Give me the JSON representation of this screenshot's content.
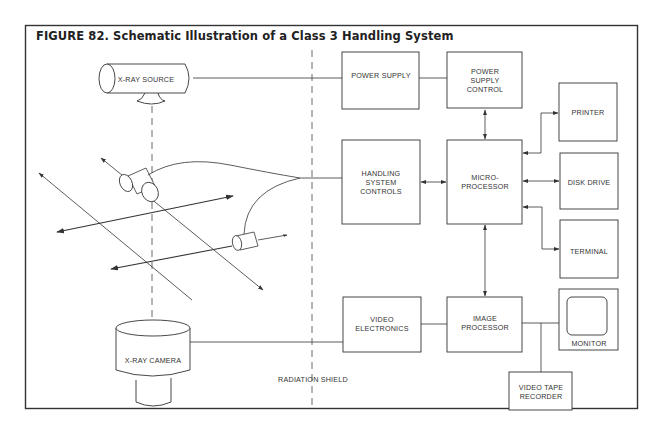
{
  "figure": {
    "title": "FIGURE 82. Schematic Illustration of a Class 3 Handling System",
    "line_color": "#333333",
    "background": "#ffffff"
  },
  "left_side": {
    "xray_source": "X-RAY SOURCE",
    "xray_camera": "X-RAY CAMERA",
    "radiation_shield": "RADIATION SHIELD"
  },
  "blocks": {
    "power_supply": [
      "POWER SUPPLY"
    ],
    "power_supply_control": [
      "POWER",
      "SUPPLY",
      "CONTROL"
    ],
    "printer": [
      "PRINTER"
    ],
    "handling_system_controls": [
      "HANDLING",
      "SYSTEM",
      "CONTROLS"
    ],
    "microprocessor": [
      "MICRO-",
      "PROCESSOR"
    ],
    "disk_drive": [
      "DISK DRIVE"
    ],
    "terminal": [
      "TERMINAL"
    ],
    "video_electronics": [
      "VIDEO",
      "ELECTRONICS"
    ],
    "image_processor": [
      "IMAGE",
      "PROCESSOR"
    ],
    "monitor": [
      "MONITOR"
    ],
    "video_tape_recorder": [
      "VIDEO TAPE",
      "RECORDER"
    ]
  },
  "connections": [
    {
      "from": "X-RAY SOURCE",
      "to": "POWER SUPPLY",
      "type": "line"
    },
    {
      "from": "POWER SUPPLY",
      "to": "POWER SUPPLY CONTROL",
      "type": "line"
    },
    {
      "from": "POWER SUPPLY CONTROL",
      "to": "MICRO-PROCESSOR",
      "type": "bidirectional"
    },
    {
      "from": "HANDLING SYSTEM CONTROLS",
      "to": "MICRO-PROCESSOR",
      "type": "bidirectional"
    },
    {
      "from": "MICRO-PROCESSOR",
      "to": "PRINTER",
      "type": "bidirectional"
    },
    {
      "from": "MICRO-PROCESSOR",
      "to": "DISK DRIVE",
      "type": "bidirectional"
    },
    {
      "from": "MICRO-PROCESSOR",
      "to": "TERMINAL",
      "type": "bidirectional"
    },
    {
      "from": "MICRO-PROCESSOR",
      "to": "IMAGE PROCESSOR",
      "type": "bidirectional"
    },
    {
      "from": "X-RAY CAMERA",
      "to": "VIDEO ELECTRONICS",
      "type": "line"
    },
    {
      "from": "VIDEO ELECTRONICS",
      "to": "IMAGE PROCESSOR",
      "type": "line"
    },
    {
      "from": "IMAGE PROCESSOR",
      "to": "MONITOR",
      "type": "line"
    },
    {
      "from": "IMAGE PROCESSOR",
      "to": "VIDEO TAPE RECORDER",
      "type": "line"
    },
    {
      "from": "Manipulator actuators",
      "to": "HANDLING SYSTEM CONTROLS",
      "type": "cable"
    }
  ]
}
